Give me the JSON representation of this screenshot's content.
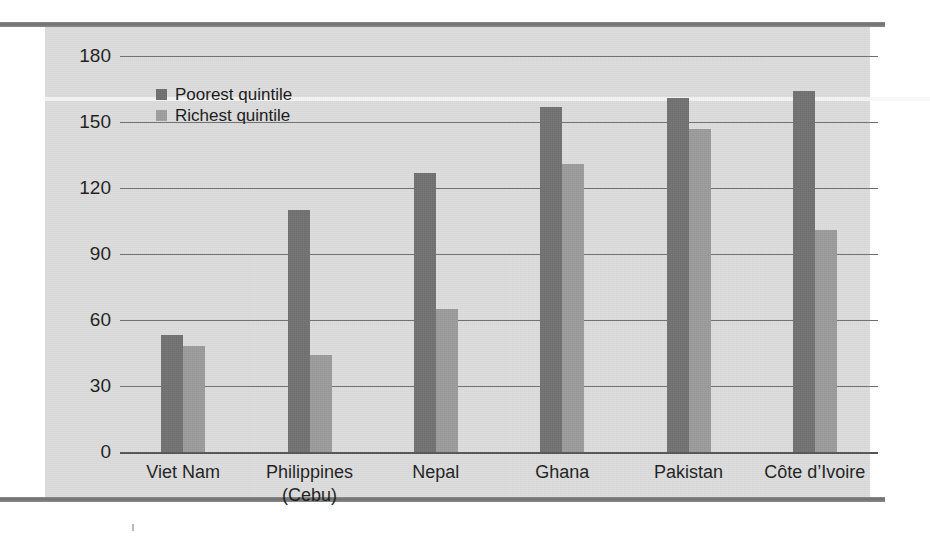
{
  "figure": {
    "panel_bg": "#dcdcdc",
    "rule_color": "#7b7b7b"
  },
  "legend": {
    "position": "top-left-inside",
    "items": [
      {
        "label": "Poorest quintile",
        "color": "#6e6e6e",
        "key": "poorest"
      },
      {
        "label": "Richest quintile",
        "color": "#9c9c9c",
        "key": "richest"
      }
    ]
  },
  "axis": {
    "y_ticks": [
      "180",
      "150",
      "120",
      "90",
      "60",
      "30",
      "0"
    ],
    "x_ticks": [
      {
        "line1": "Viet Nam",
        "line2": ""
      },
      {
        "line1": "Philippines",
        "line2": "(Cebu)"
      },
      {
        "line1": "Nepal",
        "line2": ""
      },
      {
        "line1": "Ghana",
        "line2": ""
      },
      {
        "line1": "Pakistan",
        "line2": ""
      },
      {
        "line1": "Côte d’Ivoire",
        "line2": ""
      }
    ]
  },
  "chart_data": {
    "type": "bar",
    "title": "",
    "subtitle": "",
    "xlabel": "",
    "ylabel": "",
    "ylim": [
      0,
      180
    ],
    "ytick_step": 30,
    "grid": true,
    "legend_position": "upper left",
    "categories": [
      "Viet Nam",
      "Philippines (Cebu)",
      "Nepal",
      "Ghana",
      "Pakistan",
      "Côte d’Ivoire"
    ],
    "series": [
      {
        "name": "Poorest quintile",
        "color": "#707070",
        "values": [
          53,
          110,
          127,
          157,
          161,
          164
        ]
      },
      {
        "name": "Richest quintile",
        "color": "#9a9a9a",
        "values": [
          48,
          44,
          65,
          131,
          147,
          101
        ]
      }
    ]
  }
}
